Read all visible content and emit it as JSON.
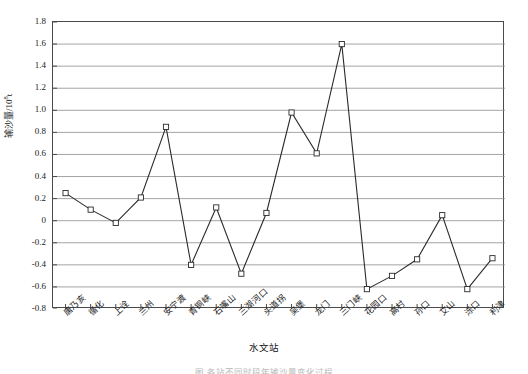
{
  "chart_data": {
    "type": "line",
    "title": "",
    "xlabel": "水文站",
    "ylabel": "输沙量/10⁸t",
    "ylabel_base": "输沙量/10",
    "ylabel_exp": "8",
    "ylabel_unit": "t",
    "ylim": [
      -0.8,
      1.8
    ],
    "ytick_step": 0.2,
    "grid": true,
    "legend": "none",
    "marker": "open-square",
    "line_color": "#2b2b2b",
    "grid_color": "#8d8d8d",
    "axis_color": "#4a4a4a",
    "ytick_labels": [
      "1.8",
      "1.6",
      "1.4",
      "1.2",
      "1.0",
      "0.8",
      "0.6",
      "0.4",
      "0.2",
      "0",
      "-0.2",
      "-0.4",
      "-0.6",
      "-0.8"
    ],
    "ytick_values": [
      1.8,
      1.6,
      1.4,
      1.2,
      1.0,
      0.8,
      0.6,
      0.4,
      0.2,
      0,
      -0.2,
      -0.4,
      -0.6,
      -0.8
    ],
    "categories": [
      "唐乃亥",
      "循化",
      "上诠",
      "兰州",
      "安宁渡",
      "青铜峡",
      "石嘴山",
      "三湖河口",
      "头道拐",
      "吴堡",
      "龙门",
      "三门峡",
      "花园口",
      "高村",
      "孙口",
      "艾山",
      "泺口",
      "利津"
    ],
    "values": [
      0.25,
      0.1,
      -0.02,
      0.21,
      0.85,
      -0.4,
      0.12,
      -0.48,
      0.07,
      0.98,
      0.61,
      1.6,
      -0.62,
      -0.5,
      -0.35,
      0.05,
      -0.62,
      -0.34
    ]
  },
  "caption": {
    "text": "图 各站不同时段年输沙量变化过程"
  }
}
